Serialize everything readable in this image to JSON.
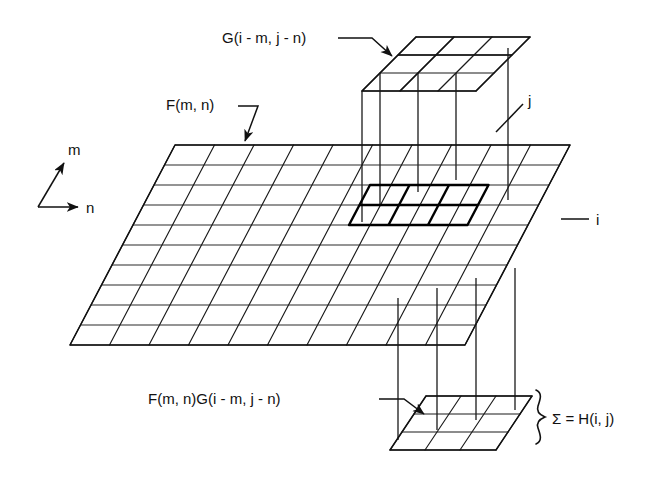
{
  "figure": {
    "type": "technical-diagram",
    "background_color": "#ffffff",
    "ink_color": "#111111"
  },
  "labels": {
    "kernel_top": "G(i - m, j - n)",
    "input_plane": "F(m, n)",
    "product_plane": "F(m, n)G(i - m, j - n)",
    "sum_result": "Σ = H(i, j)",
    "axis_m": "m",
    "axis_n": "n",
    "axis_i": "i",
    "axis_j": "j"
  },
  "grids": {
    "top_kernel": {
      "name": "G(i - m, j - n)",
      "rows": 3,
      "cols": 3,
      "shape": "parallelogram"
    },
    "main_plane": {
      "name": "F(m, n)",
      "rows": 10,
      "cols": 10,
      "shape": "parallelogram",
      "highlight_rows": 2,
      "highlight_cols": 3
    },
    "bottom_output": {
      "name": "F(m, n)G(i - m, j - n)",
      "rows": 3,
      "cols": 3,
      "shape": "parallelogram"
    }
  },
  "annotations": {
    "projection_lines": 4,
    "brace_side": "right",
    "arrow_count": 3
  }
}
